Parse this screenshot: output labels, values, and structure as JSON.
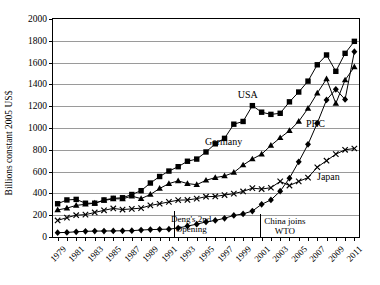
{
  "chart_data": {
    "type": "line",
    "title": "",
    "xlabel": "",
    "ylabel": "Billions constant 2005 US$",
    "ylim": [
      0,
      2000
    ],
    "ytick_step": 200,
    "xlim": [
      1979,
      2012
    ],
    "grid": true,
    "legend": "inline-annotations",
    "yticks": [
      "0",
      "200",
      "400",
      "600",
      "800",
      "1000",
      "1200",
      "1400",
      "1600",
      "1800",
      "2000"
    ],
    "x": [
      1979,
      1980,
      1981,
      1982,
      1983,
      1984,
      1985,
      1986,
      1987,
      1988,
      1989,
      1990,
      1991,
      1992,
      1993,
      1994,
      1995,
      1996,
      1997,
      1998,
      1999,
      2000,
      2001,
      2002,
      2003,
      2004,
      2005,
      2006,
      2007,
      2008,
      2009,
      2010,
      2011
    ],
    "xticklabels": [
      "1979",
      "1981",
      "1983",
      "1985",
      "1987",
      "1989",
      "1991",
      "1993",
      "1995",
      "1997",
      "1999",
      "2001",
      "2003",
      "2005",
      "2007",
      "2009",
      "2011"
    ],
    "series": [
      {
        "name": "USA",
        "marker": "square",
        "color": "#000000",
        "values": [
          305,
          340,
          345,
          310,
          310,
          340,
          355,
          360,
          390,
          425,
          495,
          555,
          605,
          645,
          695,
          715,
          780,
          855,
          905,
          1035,
          1060,
          1205,
          1145,
          1125,
          1135,
          1240,
          1330,
          1430,
          1580,
          1670,
          1520,
          1685,
          1795
        ]
      },
      {
        "name": "Germany",
        "marker": "triangle",
        "color": "#000000",
        "values": [
          248,
          265,
          290,
          300,
          310,
          335,
          350,
          350,
          375,
          352,
          390,
          445,
          490,
          515,
          490,
          480,
          520,
          545,
          560,
          592,
          660,
          715,
          760,
          840,
          910,
          975,
          1060,
          1180,
          1320,
          1450,
          1225,
          1440,
          1560
        ]
      },
      {
        "name": "Japan",
        "marker": "cross",
        "color": "#000000",
        "values": [
          152,
          178,
          200,
          205,
          225,
          245,
          262,
          252,
          258,
          265,
          290,
          305,
          322,
          338,
          340,
          352,
          370,
          372,
          385,
          398,
          418,
          448,
          440,
          452,
          510,
          472,
          510,
          545,
          640,
          700,
          760,
          800,
          812
        ]
      },
      {
        "name": "PRC",
        "marker": "diamond",
        "color": "#000000",
        "values": [
          40,
          42,
          48,
          52,
          54,
          55,
          56,
          57,
          58,
          64,
          68,
          70,
          72,
          82,
          100,
          118,
          138,
          152,
          172,
          198,
          212,
          238,
          300,
          340,
          420,
          540,
          690,
          850,
          1045,
          1258,
          1355,
          1262,
          1700
        ]
      }
    ],
    "series_labels": [
      {
        "text": "USA",
        "x": 2000,
        "y": 1310
      },
      {
        "text": "Germany",
        "x": 1997.4,
        "y": 880
      },
      {
        "text": "PRC",
        "x": 2007.3,
        "y": 1045
      },
      {
        "text": "Japan",
        "x": 2008.7,
        "y": 560
      }
    ],
    "annotations": [
      {
        "id": "dengs-2nd-opening",
        "line1": "Deng's 2nd",
        "line2": "Opening",
        "event_x": 1992,
        "text_x": 1993.9,
        "text_y": 215
      },
      {
        "id": "china-joins-wto",
        "line1": "China joins",
        "line2": "WTO",
        "event_x": 2001.3,
        "text_x": 2004.0,
        "text_y": 190
      }
    ]
  }
}
